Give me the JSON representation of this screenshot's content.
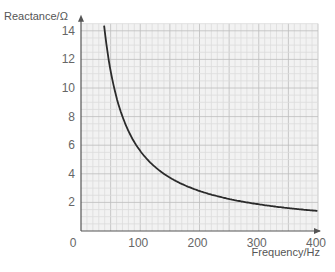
{
  "chart_data": {
    "type": "line",
    "title": "",
    "xlabel": "Frequency/Hz",
    "ylabel": "Reactance/Ω",
    "xlim": [
      0,
      400
    ],
    "ylim": [
      0,
      14.5
    ],
    "x_ticks": [
      "0",
      "100",
      "200",
      "300",
      "400"
    ],
    "y_ticks": [
      "2",
      "4",
      "6",
      "8",
      "10",
      "12",
      "14"
    ],
    "grid": true,
    "legend": null,
    "series": [
      {
        "name": "Reactance",
        "x": [
          39,
          50,
          60,
          75,
          100,
          125,
          150,
          200,
          250,
          300,
          350,
          400
        ],
        "y": [
          14.4,
          11.2,
          9.3,
          7.5,
          5.6,
          4.5,
          3.7,
          2.8,
          2.2,
          1.9,
          1.6,
          1.4
        ]
      }
    ]
  },
  "colors": {
    "plot_background": "#f2f2f2",
    "minor_grid": "#dcdcdc",
    "major_grid": "#bdbdbd",
    "axis": "#555555",
    "curve": "#2b2b2b"
  }
}
